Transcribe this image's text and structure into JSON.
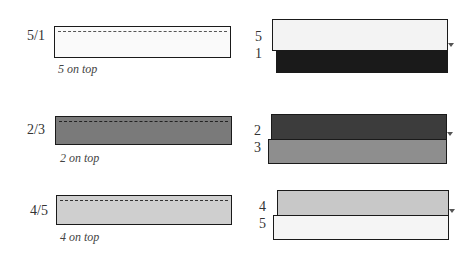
{
  "left_panel": {
    "rows": [
      {
        "label": "5/1",
        "caption": "5 on top",
        "fill": "#fafafa"
      },
      {
        "label": "2/3",
        "caption": "2 on top",
        "fill": "#7a7a7a"
      },
      {
        "label": "4/5",
        "caption": "4 on top",
        "fill": "#cfcfcf"
      }
    ]
  },
  "right_panel": {
    "rows": [
      {
        "top_label": "5",
        "bottom_label": "1",
        "top_fill": "#f3f3f3",
        "bottom_fill": "#1a1a1a"
      },
      {
        "top_label": "2",
        "bottom_label": "3",
        "top_fill": "#3c3c3c",
        "bottom_fill": "#8e8e8e"
      },
      {
        "top_label": "4",
        "bottom_label": "5",
        "top_fill": "#c8c8c8",
        "bottom_fill": "#f5f5f5"
      }
    ]
  }
}
